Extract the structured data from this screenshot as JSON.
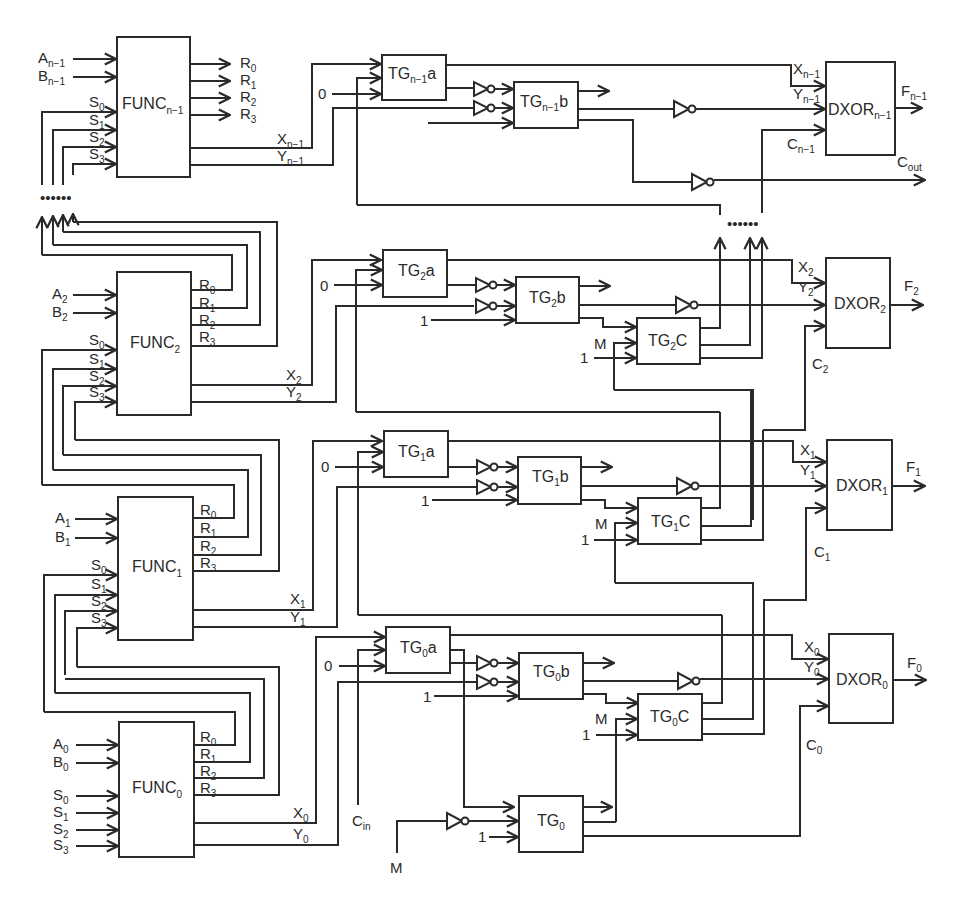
{
  "diagram": {
    "type": "n-bit ALU stage circuit",
    "func_blocks": [
      {
        "id": "func_n1",
        "label": "FUNC",
        "sub": "n−1",
        "inputs": {
          "A": "A",
          "A_sub": "n−1",
          "B": "B",
          "B_sub": "n−1"
        },
        "s_labels": [
          "S",
          "S",
          "S",
          "S"
        ],
        "s_subs": [
          "0",
          "1",
          "2",
          "3"
        ],
        "r_labels": [
          "R",
          "R",
          "R",
          "R"
        ],
        "r_subs": [
          "0",
          "1",
          "2",
          "3"
        ],
        "x": "X",
        "x_sub": "n−1",
        "y": "Y",
        "y_sub": "n−1"
      },
      {
        "id": "func_2",
        "label": "FUNC",
        "sub": "2",
        "inputs": {
          "A": "A",
          "A_sub": "2",
          "B": "B",
          "B_sub": "2"
        },
        "x": "X",
        "x_sub": "2",
        "y": "Y",
        "y_sub": "2"
      },
      {
        "id": "func_1",
        "label": "FUNC",
        "sub": "1",
        "inputs": {
          "A": "A",
          "A_sub": "1",
          "B": "B",
          "B_sub": "1"
        },
        "x": "X",
        "x_sub": "1",
        "y": "Y",
        "y_sub": "1"
      },
      {
        "id": "func_0",
        "label": "FUNC",
        "sub": "0",
        "inputs": {
          "A": "A",
          "A_sub": "0",
          "B": "B",
          "B_sub": "0"
        },
        "x": "X",
        "x_sub": "0",
        "y": "Y",
        "y_sub": "0"
      }
    ],
    "tg_blocks": {
      "tg_n1a": {
        "label": "TG",
        "sub": "n−1",
        "suffix": "a"
      },
      "tg_n1b": {
        "label": "TG",
        "sub": "n−1",
        "suffix": "b"
      },
      "tg_2a": {
        "label": "TG",
        "sub": "2",
        "suffix": "a"
      },
      "tg_2b": {
        "label": "TG",
        "sub": "2",
        "suffix": "b"
      },
      "tg_2c": {
        "label": "TG",
        "sub": "2",
        "suffix": "C"
      },
      "tg_1a": {
        "label": "TG",
        "sub": "1",
        "suffix": "a"
      },
      "tg_1b": {
        "label": "TG",
        "sub": "1",
        "suffix": "b"
      },
      "tg_1c": {
        "label": "TG",
        "sub": "1",
        "suffix": "C"
      },
      "tg_0a": {
        "label": "TG",
        "sub": "0",
        "suffix": "a"
      },
      "tg_0b": {
        "label": "TG",
        "sub": "0",
        "suffix": "b"
      },
      "tg_0c": {
        "label": "TG",
        "sub": "0",
        "suffix": "C"
      },
      "tg_0": {
        "label": "TG",
        "sub": "0",
        "suffix": ""
      }
    },
    "dxor_blocks": [
      {
        "id": "dxor_n1",
        "label": "DXOR",
        "sub": "n−1",
        "out": "F",
        "out_sub": "n−1",
        "x": "X",
        "x_sub": "n−1",
        "y": "Y",
        "y_sub": "n−1",
        "c": "C",
        "c_sub": "n−1"
      },
      {
        "id": "dxor_2",
        "label": "DXOR",
        "sub": "2",
        "out": "F",
        "out_sub": "2",
        "x": "X",
        "x_sub": "2",
        "y": "Y",
        "y_sub": "2",
        "c": "C",
        "c_sub": "2"
      },
      {
        "id": "dxor_1",
        "label": "DXOR",
        "sub": "1",
        "out": "F",
        "out_sub": "1",
        "x": "X",
        "x_sub": "1",
        "y": "Y",
        "y_sub": "1",
        "c": "C",
        "c_sub": "1"
      },
      {
        "id": "dxor_0",
        "label": "DXOR",
        "sub": "0",
        "out": "F",
        "out_sub": "0",
        "x": "X",
        "x_sub": "0",
        "y": "Y",
        "y_sub": "0",
        "c": "C",
        "c_sub": "0"
      }
    ],
    "constants": {
      "zero": "0",
      "one": "1",
      "mode": "M"
    },
    "carry_in": {
      "label": "C",
      "sub": "in"
    },
    "carry_out": {
      "label": "C",
      "sub": "out"
    },
    "ellipsis": "••••••"
  }
}
